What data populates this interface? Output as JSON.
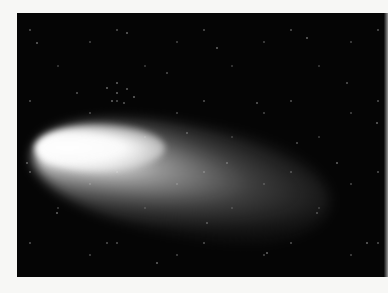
{
  "image": {
    "subject": "comet with bright coma and diffuse tail against a star field",
    "description": "Black-and-white astronomical photograph of a comet; bright nucleus at left, tail fanning toward the right, many background stars",
    "colors": {
      "background_margin": "#f7f7f5",
      "sky": "#050505",
      "nucleus": "#ffffff"
    }
  }
}
